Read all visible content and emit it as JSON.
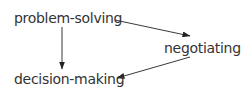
{
  "diagram": {
    "nodes": [
      {
        "id": "problem-solving",
        "label": "problem-solving"
      },
      {
        "id": "negotiating",
        "label": "negotiating"
      },
      {
        "id": "decision-making",
        "label": "decision-making"
      }
    ],
    "edges": [
      {
        "from": "problem-solving",
        "to": "negotiating"
      },
      {
        "from": "problem-solving",
        "to": "decision-making"
      },
      {
        "from": "negotiating",
        "to": "decision-making"
      }
    ],
    "colors": {
      "text": "#333333",
      "arrow": "#222222",
      "background": "#ffffff"
    }
  }
}
